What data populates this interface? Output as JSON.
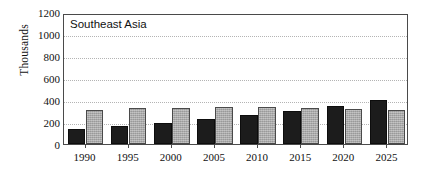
{
  "chart_data": {
    "type": "bar",
    "title": "Southeast Asia",
    "xlabel": "",
    "ylabel": "Thousands",
    "categories": [
      "1990",
      "1995",
      "2000",
      "2005",
      "2010",
      "2015",
      "2020",
      "2025"
    ],
    "series": [
      {
        "name": "dark",
        "color": "#1c1c1c",
        "values": [
          135,
          165,
          195,
          230,
          265,
          305,
          350,
          400
        ]
      },
      {
        "name": "light",
        "color": "#a8a8a8",
        "values": [
          310,
          325,
          332,
          337,
          335,
          330,
          322,
          310
        ]
      }
    ],
    "ylim": [
      0,
      1200
    ],
    "ytick_values": [
      0,
      200,
      400,
      600,
      800,
      1000,
      1200
    ],
    "ytick_labels": [
      "0",
      "200",
      "400",
      "600",
      "800",
      "1000",
      "1200"
    ],
    "grid": "horizontal-dotted",
    "legend": "none"
  },
  "axis": {
    "y_title": "Thousands"
  }
}
